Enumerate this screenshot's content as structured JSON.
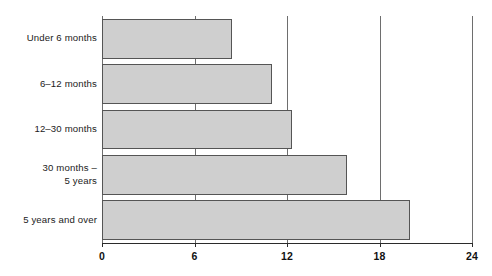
{
  "chart_data": {
    "type": "bar",
    "orientation": "horizontal",
    "title": "",
    "xlabel": "",
    "ylabel": "",
    "categories": [
      "Under 6 months",
      "6–12 months",
      "12–30 months",
      "30 months –\n5 years",
      "5 years and over"
    ],
    "values": [
      8.4,
      11.0,
      12.3,
      15.9,
      20.0
    ],
    "xlim": [
      0,
      24
    ],
    "xticks": [
      0,
      6,
      12,
      18,
      24
    ],
    "xtick_labels": [
      "0",
      "6",
      "12",
      "18",
      "24"
    ],
    "grid": "vertical",
    "legend": "none",
    "bar_fill_color": "#cfcfcf",
    "bar_border_color": "#555555",
    "gridline_color": "#6e6e6e",
    "axis_color": "#2b2b2b"
  }
}
